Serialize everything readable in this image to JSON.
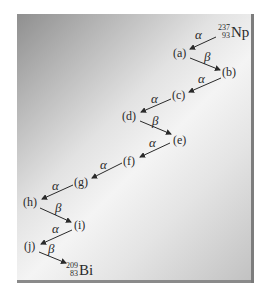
{
  "diagram": {
    "start": {
      "mass": "237",
      "atomic": "93",
      "symbol": "Np"
    },
    "end": {
      "mass": "209",
      "atomic": "83",
      "symbol": "Bi"
    },
    "nodes": [
      "(a)",
      "(b)",
      "(c)",
      "(d)",
      "(e)",
      "(f)",
      "(g)",
      "(h)",
      "(i)",
      "(j)"
    ],
    "decays": [
      {
        "from": "Np",
        "to": "(a)",
        "type": "α"
      },
      {
        "from": "(a)",
        "to": "(b)",
        "type": "β"
      },
      {
        "from": "(b)",
        "to": "(c)",
        "type": "α"
      },
      {
        "from": "(c)",
        "to": "(d)",
        "type": "α"
      },
      {
        "from": "(d)",
        "to": "(e)",
        "type": "β"
      },
      {
        "from": "(e)",
        "to": "(f)",
        "type": "α"
      },
      {
        "from": "(f)",
        "to": "(g)",
        "type": "α"
      },
      {
        "from": "(g)",
        "to": "(h)",
        "type": "α"
      },
      {
        "from": "(h)",
        "to": "(i)",
        "type": "β"
      },
      {
        "from": "(i)",
        "to": "(j)",
        "type": "α"
      },
      {
        "from": "(j)",
        "to": "Bi",
        "type": "β"
      }
    ],
    "colors": {
      "arrow": "#2a2a2a",
      "panel_dark": "#8f8f8f",
      "panel_light": "#f4f4f4"
    }
  }
}
